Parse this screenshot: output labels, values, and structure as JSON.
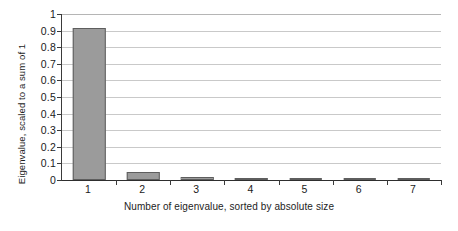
{
  "chart_data": {
    "type": "bar",
    "title": "",
    "subtitle": "",
    "xlabel": "Number of eigenvalue, sorted by absolute size",
    "ylabel": "Eigenvalue, scaled to a sum of 1",
    "categories": [
      "1",
      "2",
      "3",
      "4",
      "5",
      "6",
      "7"
    ],
    "values": [
      0.915,
      0.05,
      0.02,
      0.008,
      0.002,
      0.002,
      0.001
    ],
    "series": [
      {
        "name": "Eigenvalue",
        "values": [
          0.915,
          0.05,
          0.02,
          0.008,
          0.002,
          0.002,
          0.001
        ]
      }
    ],
    "ylim": [
      0,
      1
    ],
    "xlim_categories": 7,
    "ytick_values": [
      0,
      0.1,
      0.2,
      0.3,
      0.4,
      0.5,
      0.6,
      0.7,
      0.8,
      0.9,
      1
    ],
    "ytick_labels": [
      "0",
      "0.1",
      "0.2",
      "0.3",
      "0.4",
      "0.5",
      "0.6",
      "0.7",
      "0.8",
      "0.9",
      "1"
    ],
    "grid": "horizontal",
    "legend": "none",
    "annotations": [],
    "colors": {
      "bar_fill": "#9b9b9b",
      "bar_stroke": "#5e5e5e",
      "gridline": "#c9c9c9",
      "axis": "#2e2e2e",
      "text": "#1a1a1a",
      "background": "#ffffff"
    }
  }
}
